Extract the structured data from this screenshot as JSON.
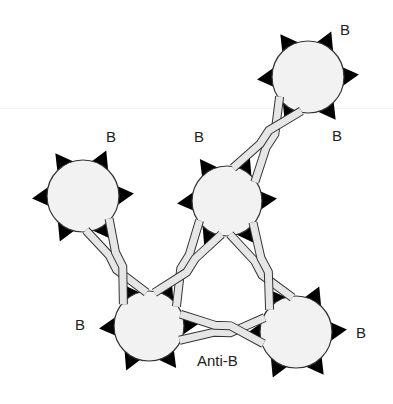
{
  "diagram": {
    "colors": {
      "cell_fill": "#f2f2f2",
      "cell_stroke": "#333333",
      "antigen_fill": "#000000",
      "antibody_fill": "#e6e6e6",
      "antibody_stroke": "#333333",
      "text": "#222222"
    },
    "cells": [
      {
        "id": "cell-top-right",
        "cx": 308,
        "cy": 77,
        "r": 36,
        "antigen_angles": [
          -120,
          -60,
          0,
          60,
          120,
          180
        ]
      },
      {
        "id": "cell-left",
        "cx": 83,
        "cy": 196,
        "r": 36,
        "antigen_angles": [
          -120,
          -60,
          0,
          60,
          120,
          180
        ]
      },
      {
        "id": "cell-middle",
        "cx": 227,
        "cy": 201,
        "r": 35,
        "antigen_angles": [
          -120,
          -60,
          0,
          60,
          120,
          180
        ]
      },
      {
        "id": "cell-bottom-left",
        "cx": 149,
        "cy": 326,
        "r": 35,
        "antigen_angles": [
          -120,
          -60,
          0,
          60,
          120,
          180
        ]
      },
      {
        "id": "cell-bottom-right",
        "cx": 296,
        "cy": 332,
        "r": 36,
        "antigen_angles": [
          -120,
          -60,
          0,
          60,
          120,
          180
        ]
      }
    ],
    "antibodies": [
      {
        "id": "antibody-top",
        "from": "cell-middle",
        "to": "cell-top-right"
      },
      {
        "id": "antibody-left",
        "from": "cell-left",
        "to": "cell-bottom-left"
      },
      {
        "id": "antibody-center-left",
        "from": "cell-middle",
        "to": "cell-bottom-left"
      },
      {
        "id": "antibody-center-right",
        "from": "cell-middle",
        "to": "cell-bottom-right"
      },
      {
        "id": "antibody-bottom",
        "from": "cell-bottom-left",
        "to": "cell-bottom-right"
      }
    ],
    "labels": [
      {
        "id": "label-b-top-right-upper",
        "text": "B",
        "x": 340,
        "y": 35
      },
      {
        "id": "label-b-top-right-lower",
        "text": "B",
        "x": 332,
        "y": 141
      },
      {
        "id": "label-b-left",
        "text": "B",
        "x": 106,
        "y": 142
      },
      {
        "id": "label-b-middle",
        "text": "B",
        "x": 194,
        "y": 142
      },
      {
        "id": "label-b-bottom-left",
        "text": "B",
        "x": 75,
        "y": 330
      },
      {
        "id": "label-b-bottom-right",
        "text": "B",
        "x": 356,
        "y": 338
      },
      {
        "id": "label-anti-b",
        "text": "Anti-B",
        "x": 197,
        "y": 366
      }
    ]
  }
}
